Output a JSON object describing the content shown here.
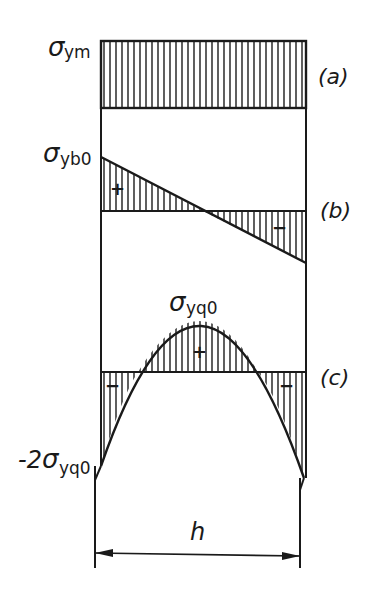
{
  "diagram": {
    "labels": {
      "sigma_ym": {
        "symbol": "σ",
        "sub": "ym"
      },
      "sigma_yb0": {
        "symbol": "σ",
        "sub": "yb0"
      },
      "sigma_yq0": {
        "symbol": "σ",
        "sub": "yq0"
      },
      "neg_2_sigma_yq0": {
        "prefix": "-2",
        "symbol": "σ",
        "sub": "yq0"
      },
      "case_a": "(a)",
      "case_b": "(b)",
      "case_c": "(c)",
      "width": "h",
      "plus": "+",
      "minus": "−"
    },
    "cases": [
      {
        "id": "a",
        "description": "uniform stress σym"
      },
      {
        "id": "b",
        "description": "linear bending stress, +σyb0 at left to −σyb0 at right"
      },
      {
        "id": "c",
        "description": "parabolic stress, peak +σyq0 at center, −2σyq0 at edges"
      }
    ],
    "colors": {
      "ink": "#1a1a1a",
      "background": "#ffffff"
    }
  }
}
